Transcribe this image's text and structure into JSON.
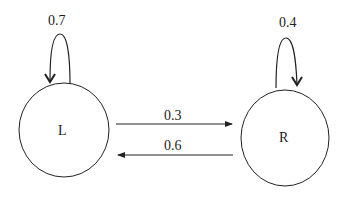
{
  "diagram": {
    "type": "markov-chain",
    "states": [
      {
        "id": "L",
        "label": "L",
        "self_loop": "0.7"
      },
      {
        "id": "R",
        "label": "R",
        "self_loop": "0.4"
      }
    ],
    "transitions": [
      {
        "from": "L",
        "to": "R",
        "label": "0.3"
      },
      {
        "from": "R",
        "to": "L",
        "label": "0.6"
      }
    ]
  }
}
